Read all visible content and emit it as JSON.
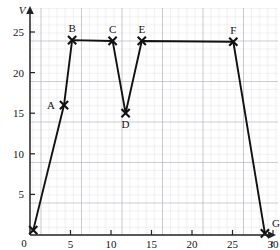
{
  "chart_data": {
    "type": "line",
    "title": "",
    "xlabel": "t",
    "ylabel": "V",
    "xlim": [
      0,
      31.5
    ],
    "ylim": [
      0,
      26.5
    ],
    "grid": true,
    "grid_minor_step": 1,
    "grid_major_step": 5,
    "legend": "none",
    "xticks": [
      0,
      5,
      10,
      15,
      20,
      25,
      30
    ],
    "xticklabels": [
      "0",
      "5",
      "10",
      "15",
      "20",
      "25",
      "30"
    ],
    "yticks": [
      5,
      10,
      15,
      20,
      25
    ],
    "yticklabels": [
      "5",
      "10",
      "15",
      "20",
      "25"
    ],
    "marker": "x",
    "series": [
      {
        "name": "V-t graph",
        "points": [
          {
            "label": "",
            "t": 0.4,
            "v": 0.6,
            "label_pos": "none"
          },
          {
            "label": "A",
            "t": 4.2,
            "v": 16.0,
            "label_pos": "left"
          },
          {
            "label": "B",
            "t": 5.2,
            "v": 24.0,
            "label_pos": "above"
          },
          {
            "label": "C",
            "t": 10.2,
            "v": 23.9,
            "label_pos": "above"
          },
          {
            "label": "D",
            "t": 11.8,
            "v": 15.0,
            "label_pos": "below"
          },
          {
            "label": "E",
            "t": 13.8,
            "v": 23.9,
            "label_pos": "above"
          },
          {
            "label": "F",
            "t": 25.1,
            "v": 23.8,
            "label_pos": "above"
          },
          {
            "label": "G",
            "t": 29.0,
            "v": 0.2,
            "label_pos": "above-right"
          }
        ]
      }
    ],
    "colors": {
      "curve": "#111111",
      "axis": "#222222",
      "grid_minor": "#cfcfd6",
      "grid_major": "#a8a8b4",
      "background": "#ffffff",
      "text": "#141414"
    }
  },
  "axis": {
    "v_label": "V",
    "t_label": "t",
    "origin_label": "0"
  },
  "labels": {
    "a": "A",
    "b": "B",
    "c": "C",
    "d": "D",
    "e": "E",
    "f": "F",
    "g": "G"
  }
}
